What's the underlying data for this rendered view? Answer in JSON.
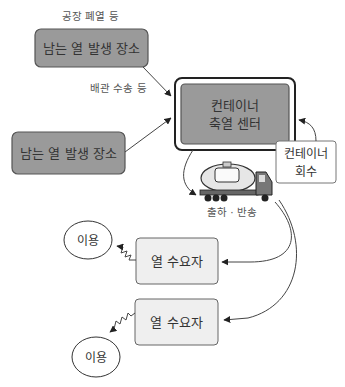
{
  "diagram": {
    "labels": {
      "factory_waste_caption": "공장 폐열 등",
      "pipe_transport_caption": "배관 수송 등",
      "shipping_caption": "출하 · 반송"
    },
    "nodes": {
      "heat_source_top": "남는 열 발생 장소",
      "heat_source_bottom": "남는 열 발생 장소",
      "storage_center_line1": "컨테이너",
      "storage_center_line2": "축열 센터",
      "container_return_line1": "컨테이너",
      "container_return_line2": "회수",
      "demand_1": "열 수요자",
      "demand_2": "열 수요자",
      "usage_1": "이용",
      "usage_2": "이용"
    },
    "icons": {
      "truck": "tank-truck-icon"
    },
    "colors": {
      "dark_box": "#9a9a9a",
      "light_box": "#efefef",
      "line": "#444444"
    }
  }
}
